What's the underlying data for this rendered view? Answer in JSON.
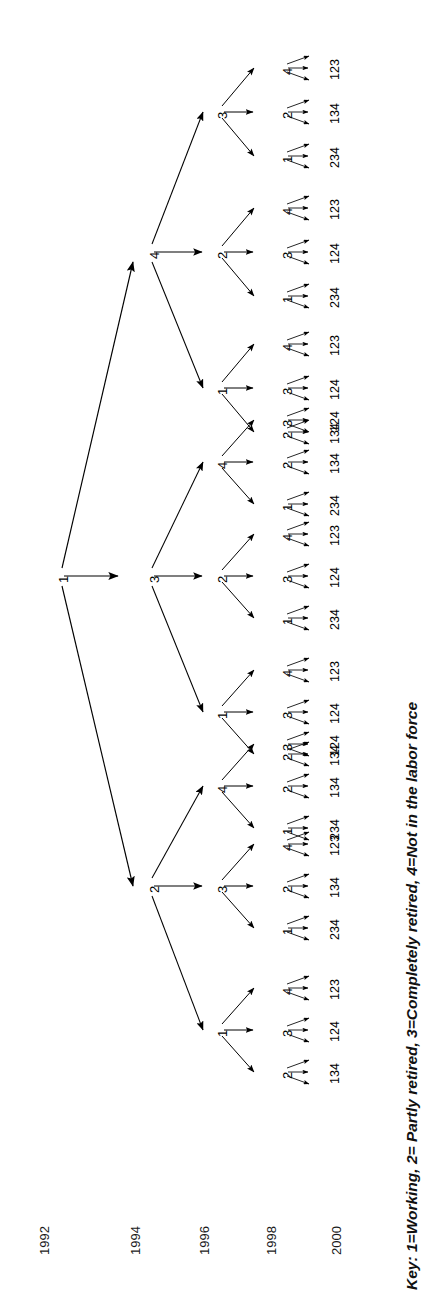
{
  "figure": {
    "type": "tree-diagram",
    "orientation": "rotated-90-ccw",
    "key_note": "Key: 1=Working, 2= Partly retired, 3=Completely retired, 4=Not in the labor force",
    "year_axis": {
      "label_name": "year-axis",
      "years": [
        "1992",
        "1994",
        "1996",
        "1998",
        "2000"
      ]
    },
    "legend_map": {
      "1": "Working",
      "2": "Partly retired",
      "3": "Completely retired",
      "4": "Not in the labor force"
    },
    "root": {
      "year": "1992",
      "label": "1"
    },
    "level_1994": [
      {
        "label": "4"
      },
      {
        "label": "3"
      },
      {
        "label": "2"
      }
    ],
    "level_1996": [
      {
        "parent": "4",
        "label": "3"
      },
      {
        "parent": "4",
        "label": "2"
      },
      {
        "parent": "4",
        "label": "1"
      },
      {
        "parent": "3",
        "label": "4"
      },
      {
        "parent": "3",
        "label": "2"
      },
      {
        "parent": "3",
        "label": "1"
      },
      {
        "parent": "2",
        "label": "4"
      },
      {
        "parent": "2",
        "label": "3"
      },
      {
        "parent": "2",
        "label": "1"
      }
    ],
    "level_1998": [
      {
        "label": "4"
      },
      {
        "label": "2"
      },
      {
        "label": "1"
      },
      {
        "label": "4"
      },
      {
        "label": "3"
      },
      {
        "label": "1"
      },
      {
        "label": "4"
      },
      {
        "label": "3"
      },
      {
        "label": "2"
      },
      {
        "label": "3"
      },
      {
        "label": "2"
      },
      {
        "label": "1"
      },
      {
        "label": "4"
      },
      {
        "label": "3"
      },
      {
        "label": "1"
      },
      {
        "label": "4"
      },
      {
        "label": "3"
      },
      {
        "label": "2"
      },
      {
        "label": "3"
      },
      {
        "label": "2"
      },
      {
        "label": "1"
      },
      {
        "label": "4"
      },
      {
        "label": "2"
      },
      {
        "label": "1"
      },
      {
        "label": "4"
      },
      {
        "label": "3"
      },
      {
        "label": "2"
      }
    ],
    "level_2000": [
      {
        "label": "123"
      },
      {
        "label": "134"
      },
      {
        "label": "234"
      },
      {
        "label": "123"
      },
      {
        "label": "124"
      },
      {
        "label": "234"
      },
      {
        "label": "123"
      },
      {
        "label": "124"
      },
      {
        "label": "134"
      },
      {
        "label": "124"
      },
      {
        "label": "134"
      },
      {
        "label": "234"
      },
      {
        "label": "123"
      },
      {
        "label": "124"
      },
      {
        "label": "234"
      },
      {
        "label": "123"
      },
      {
        "label": "124"
      },
      {
        "label": "134"
      },
      {
        "label": "124"
      },
      {
        "label": "134"
      },
      {
        "label": "234"
      },
      {
        "label": "123"
      },
      {
        "label": "134"
      },
      {
        "label": "234"
      },
      {
        "label": "123"
      },
      {
        "label": "124"
      },
      {
        "label": "134"
      }
    ],
    "colors": {
      "ink": "#000000",
      "background": "#ffffff"
    }
  }
}
